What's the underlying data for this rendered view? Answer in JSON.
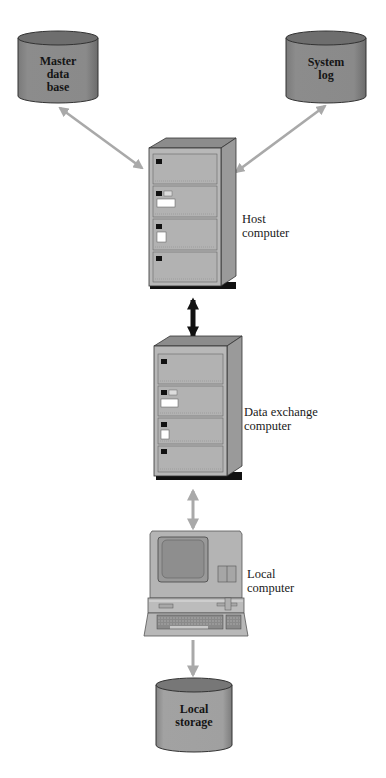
{
  "diagram": {
    "type": "system-architecture",
    "colors": {
      "cylinder_body": "#8a8a8a",
      "cylinder_top": "#6e6e6e",
      "cabinet_front": "#b8b8b8",
      "cabinet_side": "#9a9a9a",
      "cabinet_top": "#8c8c8c",
      "cabinet_base": "#111111",
      "link_arrow_gray": "#a9a9a9",
      "link_arrow_black": "#111111",
      "text": "#1a1a1a"
    },
    "nodes": {
      "master_db": {
        "lines": [
          "Master",
          "data",
          "base"
        ],
        "shape": "cylinder"
      },
      "system_log": {
        "lines": [
          "System",
          "log"
        ],
        "shape": "cylinder"
      },
      "host": {
        "lines": [
          "Host",
          "computer"
        ],
        "shape": "cabinet"
      },
      "exchange": {
        "lines": [
          "Data exchange",
          "computer"
        ],
        "shape": "cabinet"
      },
      "local_computer": {
        "lines": [
          "Local",
          "computer"
        ],
        "shape": "terminal"
      },
      "local_storage": {
        "lines": [
          "Local",
          "storage"
        ],
        "shape": "cylinder"
      }
    },
    "edges": [
      {
        "from": "host",
        "to": "master_db",
        "style": "gray-bidirectional"
      },
      {
        "from": "host",
        "to": "system_log",
        "style": "gray-bidirectional"
      },
      {
        "from": "host",
        "to": "exchange",
        "style": "black-bidirectional-thick"
      },
      {
        "from": "exchange",
        "to": "local_computer",
        "style": "gray-bidirectional"
      },
      {
        "from": "local_computer",
        "to": "local_storage",
        "style": "gray-unidirectional"
      }
    ]
  }
}
